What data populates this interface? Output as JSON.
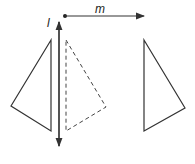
{
  "labels": {
    "line_l": "l",
    "line_m": "m"
  },
  "figures": {
    "original_triangle": {
      "style": "solid",
      "points": [
        [
          51,
          40
        ],
        [
          11,
          106
        ],
        [
          51,
          131
        ]
      ]
    },
    "reflected_triangle": {
      "style": "dashed",
      "points": [
        [
          66,
          40
        ],
        [
          106,
          107
        ],
        [
          66,
          131
        ]
      ]
    },
    "translated_triangle": {
      "style": "solid",
      "points": [
        [
          144,
          40
        ],
        [
          185,
          108
        ],
        [
          144,
          131
        ]
      ]
    }
  },
  "colors": {
    "stroke": "#333333"
  }
}
